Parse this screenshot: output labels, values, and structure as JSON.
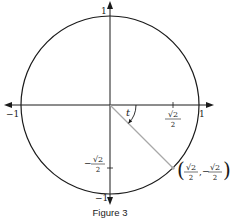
{
  "figure": {
    "caption": "Figure 3",
    "type": "unit-circle",
    "angle_label": "t",
    "angle_radians": -0.7853981634,
    "axis_labels": {
      "x_positive": "1",
      "x_negative": "−1",
      "y_positive": "1",
      "y_negative": "−1"
    },
    "ticks": {
      "x_tick": {
        "value": 0.7071,
        "numerator": "√2",
        "denominator": "2",
        "sign": ""
      },
      "y_tick": {
        "value": -0.7071,
        "numerator": "√2",
        "denominator": "2",
        "sign": "−"
      }
    },
    "point": {
      "x": 0.7071,
      "y": -0.7071,
      "label_x_num": "√2",
      "label_x_den": "2",
      "label_y_sign": "−",
      "label_y_num": "√2",
      "label_y_den": "2",
      "open_paren": "(",
      "close_paren": ")",
      "comma": ","
    },
    "colors": {
      "stroke": "#1a1a1a",
      "radius_line": "#a8a8a8",
      "point": "#a8a8a8"
    }
  }
}
